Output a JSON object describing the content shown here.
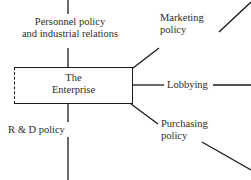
{
  "diagram": {
    "center_node": {
      "name": "enterprise",
      "line1": "The",
      "line2": "Enterprise",
      "border_style": "solid-with-dashed-left-edge",
      "border_color": "#1a1a1a"
    },
    "nodes": [
      {
        "name": "personnel-policy",
        "line1": "Personnel policy",
        "line2": "and industrial relations",
        "position": "top-left",
        "connector": "vertical-line"
      },
      {
        "name": "marketing-policy",
        "line1": "Marketing",
        "line2": "policy",
        "position": "top-right",
        "connector": "diagonal-line"
      },
      {
        "name": "lobbying",
        "line1": "Lobbying",
        "line2": "",
        "position": "middle-right",
        "connector": "horizontal-line"
      },
      {
        "name": "purchasing-policy",
        "line1": "Purchasing",
        "line2": "policy",
        "position": "bottom-right",
        "connector": "diagonal-line"
      },
      {
        "name": "r-and-d-policy",
        "line1": "R & D policy",
        "line2": "",
        "position": "bottom-left",
        "connector": "vertical-line"
      }
    ],
    "colors": {
      "line": "#1a1a1a",
      "text": "#2b2b2b",
      "background": "#ffffff"
    }
  }
}
